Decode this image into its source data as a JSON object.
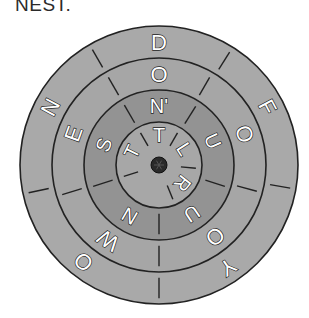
{
  "caption": "NEST.",
  "wheel": {
    "center": [
      159,
      165
    ],
    "colors": {
      "outer_ring": "#a9a9a9",
      "second_ring": "#a6a6a6",
      "third_ring": "#939393",
      "core": "#a7a7a7",
      "line": "#222222",
      "hub": "#2a2a2a",
      "letter_fill": "#ffffff"
    },
    "rings": [
      {
        "name": "outer",
        "outer_radius": 139,
        "inner_radius": 107,
        "letters": [
          {
            "char": "D",
            "angle": 0
          },
          {
            "char": "F",
            "angle": 62
          },
          {
            "char": "Y",
            "angle": 146
          },
          {
            "char": "O",
            "angle": 218
          },
          {
            "char": "N",
            "angle": 298
          }
        ],
        "dividers": [
          32,
          100,
          180,
          258,
          330
        ]
      },
      {
        "name": "second",
        "outer_radius": 107,
        "inner_radius": 75,
        "letters": [
          {
            "char": "O",
            "angle": 0
          },
          {
            "char": "O",
            "angle": 70
          },
          {
            "char": "O",
            "angle": 142
          },
          {
            "char": "W",
            "angle": 214
          },
          {
            "char": "E",
            "angle": 290
          }
        ],
        "dividers": [
          30,
          105,
          180,
          253,
          330
        ]
      },
      {
        "name": "third",
        "outer_radius": 75,
        "inner_radius": 43,
        "letters": [
          {
            "char": "N'",
            "angle": 0
          },
          {
            "char": "U",
            "angle": 66
          },
          {
            "char": "U",
            "angle": 146
          },
          {
            "char": "N",
            "angle": 210
          },
          {
            "char": "S",
            "angle": 290
          }
        ],
        "dividers": [
          32,
          108,
          180,
          252,
          330
        ]
      },
      {
        "name": "core",
        "outer_radius": 43,
        "inner_radius": 0,
        "letters": [
          {
            "char": "T",
            "angle": 0
          },
          {
            "char": "L",
            "angle": 58
          },
          {
            "char": "R",
            "angle": 128
          },
          {
            "char": "T",
            "angle": 296
          }
        ],
        "dividers": [
          30,
          95,
          158,
          252,
          330
        ]
      }
    ],
    "hub_radius": 8
  }
}
